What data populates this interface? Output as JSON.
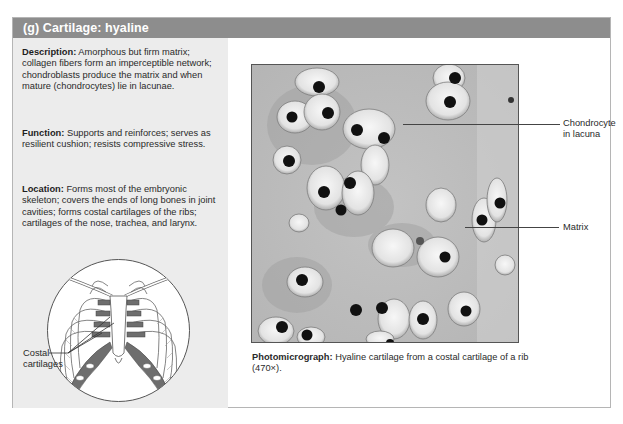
{
  "header": {
    "title": "(g)  Cartilage: hyaline",
    "background_color": "#8d8d8d"
  },
  "left_panel": {
    "background_color": "#ececec",
    "description": {
      "label": "Description:",
      "text": " Amorphous but firm matrix; collagen fibers form an imperceptible network; chondroblasts produce the matrix and when mature (chondrocytes) lie in lacunae."
    },
    "function": {
      "label": "Function:",
      "text": " Supports and reinforces; serves as resilient cushion; resists compressive stress."
    },
    "location": {
      "label": "Location:",
      "text": " Forms most of the embryonic skeleton; covers the ends of long bones in joint cavities; forms costal cartilages of the ribs; cartilages of the nose, trachea, and larynx."
    },
    "diagram": {
      "icon": "rib-cage-illustration",
      "label_line1": "Costal",
      "label_line2": "cartilages",
      "cartilage_color": "#6e6e6e"
    }
  },
  "micrograph": {
    "icon": "hyaline-cartilage-micrograph",
    "callouts": [
      {
        "label_line1": "Chondrocyte",
        "label_line2": "in lacuna"
      },
      {
        "label_line1": "Matrix",
        "label_line2": ""
      }
    ],
    "caption": {
      "label": "Photomicrograph:",
      "text": " Hyaline cartilage from a costal cartilage of a rib (470×)."
    }
  }
}
